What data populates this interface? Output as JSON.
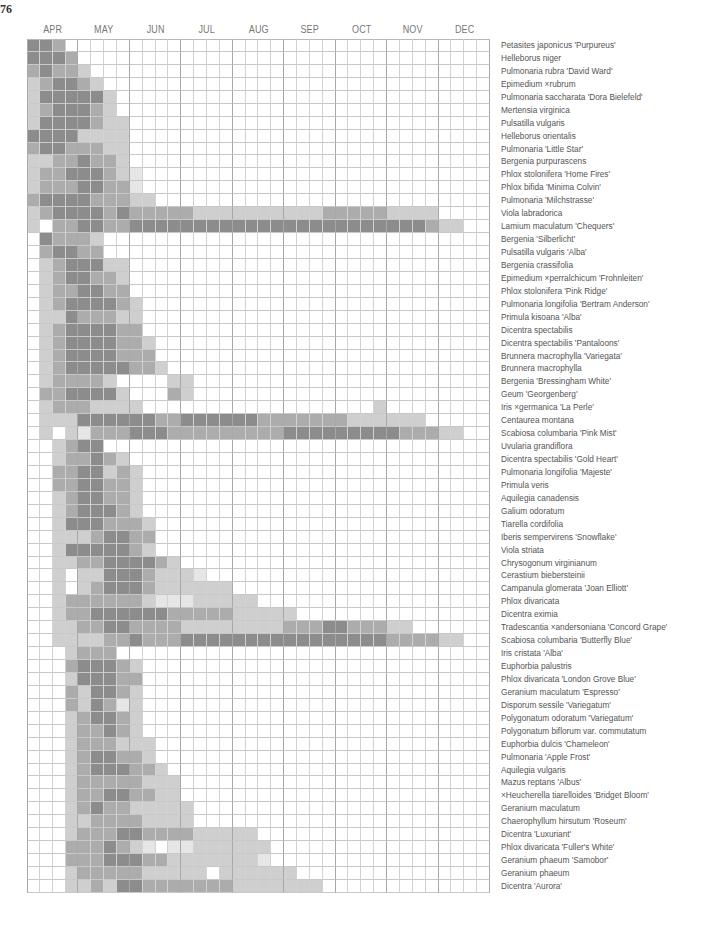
{
  "page_number": "76",
  "chart_data": {
    "type": "heatmap",
    "title": "",
    "xlabel": "",
    "ylabel": "",
    "months": [
      "APR",
      "MAY",
      "JUN",
      "JUL",
      "AUG",
      "SEP",
      "OCT",
      "NOV",
      "DEC"
    ],
    "columns_per_month": 4,
    "intensity_scale": {
      "0": "no bloom",
      "1": "trace",
      "2": "light",
      "3": "moderate",
      "4": "peak"
    },
    "colors": {
      "0": "#ffffff",
      "1": "#e6e6e6",
      "2": "#cfcfcf",
      "3": "#acacac",
      "4": "#8c8c8c"
    },
    "grid": true,
    "rows": [
      {
        "plant": "Petasites japonicus 'Purpureus'",
        "weeks": "443000000000000000000000000000000000"
      },
      {
        "plant": "Helleborus niger",
        "weeks": "444300000000000000000000000000000000"
      },
      {
        "plant": "Pulmonaria rubra 'David Ward'",
        "weeks": "343320000000000000000000000000000000"
      },
      {
        "plant": "Epimedium ×rubrum",
        "weeks": "234432000000000000000000000000000000"
      },
      {
        "plant": "Pulmonaria saccharata 'Dora Bielefeld'",
        "weeks": "244444200000000000000000000000000000"
      },
      {
        "plant": "Mertensia virginica",
        "weeks": "234443200000000000000000000000000000"
      },
      {
        "plant": "Pulsatilla vulgaris",
        "weeks": "244443220000000000000000000000000000"
      },
      {
        "plant": "Helleborus orientalis",
        "weeks": "444422220000000000000000000000000000"
      },
      {
        "plant": "Pulmonaria 'Little Star'",
        "weeks": "344333220000000000000000000000000000"
      },
      {
        "plant": "Bergenia purpurascens",
        "weeks": "223343320000000000000000000000000000"
      },
      {
        "plant": "Phlox stolonifera 'Home Fires'",
        "weeks": "233444321000000000000000000000000000"
      },
      {
        "plant": "Phlox bifida 'Minima Colvin'",
        "weeks": "233344331000000000000000000000000000"
      },
      {
        "plant": "Pulmonaria 'Milchstrasse'",
        "weeks": "344443332200000000000000000000000000"
      },
      {
        "plant": "Viola labradorica",
        "weeks": "234444343333322222222223333322220000"
      },
      {
        "plant": "Lamium maculatum 'Chequers'",
        "weeks": "203344334444444444444444444444432200"
      },
      {
        "plant": "Bergenia 'Silberlicht'",
        "weeks": "043332000000000000000000000000000000"
      },
      {
        "plant": "Pulsatilla vulgaris 'Alba'",
        "weeks": "034433000000000000000000000000000000"
      },
      {
        "plant": "Bergenia crassifolia",
        "weeks": "023444220000000000000000000000000000"
      },
      {
        "plant": "Epimedium ×perralchicum 'Frohnleiten'",
        "weeks": "023443320000000000000000000000000000"
      },
      {
        "plant": "Phlox stolonifera 'Pink Ridge'",
        "weeks": "023344330000000000000000000000000000"
      },
      {
        "plant": "Pulmonaria longifolia 'Bertram Anderson'",
        "weeks": "023444432000000000000000000000000000"
      },
      {
        "plant": "Primula kisoana 'Alba'",
        "weeks": "022433322000000000000000000000000000"
      },
      {
        "plant": "Dicentra spectabilis",
        "weeks": "023444433000000000000000000000000000"
      },
      {
        "plant": "Dicentra spectabilis 'Pantaloons'",
        "weeks": "023444433200000000000000000000000000"
      },
      {
        "plant": "Brunnera macrophylla 'Variegata'",
        "weeks": "023444433300000000000000000000000000"
      },
      {
        "plant": "Brunnera macrophylla",
        "weeks": "023444443320000000000000000000000000"
      },
      {
        "plant": "Bergenia 'Bressingham White'",
        "weeks": "023333200002200000000000000000000000"
      },
      {
        "plant": "Geum 'Georgenberg'",
        "weeks": "033444420003200000000000000000000000"
      },
      {
        "plant": "Iris ×germanica 'La Perle'",
        "weeks": "023332222000000000000000000200000000"
      },
      {
        "plant": "Centaurea montana",
        "weeks": "022244444433444444333333322222200000"
      },
      {
        "plant": "Scabiosa columbaria 'Pink Mist'",
        "weeks": "020213334443333333334444444443332200"
      },
      {
        "plant": "Uvularia grandiflora",
        "weeks": "002344000000000000000000000000000000"
      },
      {
        "plant": "Dicentra spectabilis 'Gold Heart'",
        "weeks": "002334320000000000000000000000000000"
      },
      {
        "plant": "Pulmonaria longifolia 'Majeste'",
        "weeks": "003344232000000000000000000000000000"
      },
      {
        "plant": "Primula veris",
        "weeks": "003344332000000000000000000000000000"
      },
      {
        "plant": "Aquilegia canadensis",
        "weeks": "002344332000000000000000000000000000"
      },
      {
        "plant": "Galium odoratum",
        "weeks": "002344432000000000000000000000000000"
      },
      {
        "plant": "Tiarella cordifolia",
        "weeks": "002444333200000000000000000000000000"
      },
      {
        "plant": "Iberis sempervirens 'Snowflake'",
        "weeks": "002223443300000000000000000000000000"
      },
      {
        "plant": "Viola striata",
        "weeks": "002444443200000000000000000000000000"
      },
      {
        "plant": "Chrysogonum virginianum",
        "weeks": "002233444432000000000000000000000000"
      },
      {
        "plant": "Cerastium biebersteinii",
        "weeks": "002022444322210000000000000000000000"
      },
      {
        "plant": "Campanula glomerata 'Joan Elliott'",
        "weeks": "002023444322222200000000000000000000"
      },
      {
        "plant": "Phlox divaricata",
        "weeks": "002333333211122222000000000000000000"
      },
      {
        "plant": "Dicentra eximia",
        "weeks": "002334444443333322222000000000000000"
      },
      {
        "plant": "Tradescantia ×andersoniana 'Concord Grape'",
        "weeks": "002233443333222222223334433322000000"
      },
      {
        "plant": "Scabiosa columbaria 'Butterfly Blue'",
        "weeks": "002222334333444444444444444433332200"
      },
      {
        "plant": "Iris cristata 'Alba'",
        "weeks": "000233300000000000000000000000000000"
      },
      {
        "plant": "Euphorbia palustris",
        "weeks": "000344432000000000000000000000000000"
      },
      {
        "plant": "Phlox divaricata 'London Grove Blue'",
        "weeks": "000244433000000000000000000000000000"
      },
      {
        "plant": "Geranium maculatum 'Espresso'",
        "weeks": "000324432000000000000000000000000000"
      },
      {
        "plant": "Disporum sessile 'Variegatum'",
        "weeks": "000324312000000000000000000000000000"
      },
      {
        "plant": " Polygonatum odoratum 'Variegatum'",
        "weeks": "000234432000000000000000000000000000"
      },
      {
        "plant": "Polygonatum biflorum var. commutatum",
        "weeks": "000233432000000000000000000000000000"
      },
      {
        "plant": "Euphorbia dulcis 'Chameleon'",
        "weeks": "000233322200000000000000000000000000"
      },
      {
        "plant": "Pulmonaria 'Apple Frost'",
        "weeks": "000234433200000000000000000000000000"
      },
      {
        "plant": "Aquilegia vulgaris",
        "weeks": "000234443320000000000000000000000000"
      },
      {
        "plant": "Mazus reptans 'Albus'",
        "weeks": "000233333222000000000000000000000000"
      },
      {
        "plant": "×Heucherella tiarelloides 'Bridget Bloom'",
        "weeks": "000233443322000000000000000000000000"
      },
      {
        "plant": "Geranium maculatum",
        "weeks": "000234332222200000000000000000000000"
      },
      {
        "plant": "Chaerophyllum hirsutum 'Roseum'",
        "weeks": "000223333222200000000000000000000000"
      },
      {
        "plant": "Dicentra 'Luxuriant'",
        "weeks": "000233344333322222000000000000000000"
      },
      {
        "plant": "Phlox divaricata 'Fuller's White'",
        "weeks": "000333432101122222200000000000000000"
      },
      {
        "plant": "Geranium phaeum 'Samobor'",
        "weeks": "000333444332222222100000000000000000"
      },
      {
        "plant": "Geranium phaeum",
        "weeks": "000233333222220222222000000000000000"
      },
      {
        "plant": "Dicentra 'Aurora'",
        "weeks": "000223244333333322222220000000000000"
      }
    ]
  }
}
